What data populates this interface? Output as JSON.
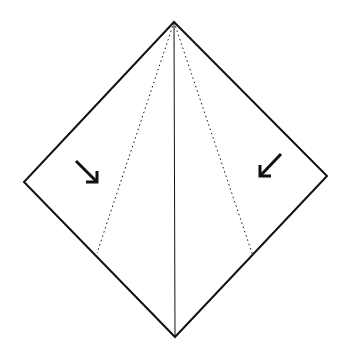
{
  "diagram": {
    "type": "origami-fold-step",
    "colors": {
      "stroke": "#111111",
      "background": "#ffffff"
    },
    "shape": {
      "top": [
        174,
        22
      ],
      "left": [
        24,
        182
      ],
      "right": [
        327,
        176
      ],
      "bottom": [
        175,
        337
      ]
    },
    "center_crease": {
      "from": [
        174,
        22
      ],
      "to": [
        175,
        337
      ],
      "style": "solid-thin"
    },
    "fold_lines": [
      {
        "name": "left-valley-fold",
        "from": [
          174,
          22
        ],
        "to": [
          97,
          253
        ],
        "style": "dotted"
      },
      {
        "name": "right-valley-fold",
        "from": [
          174,
          22
        ],
        "to": [
          253,
          256
        ],
        "style": "dotted"
      }
    ],
    "arrows": [
      {
        "name": "left-fold-arrow",
        "direction": "down-right",
        "from": [
          76,
          161
        ],
        "to": [
          97,
          182
        ]
      },
      {
        "name": "right-fold-arrow",
        "direction": "down-left",
        "from": [
          281,
          154
        ],
        "to": [
          260,
          176
        ]
      }
    ]
  }
}
